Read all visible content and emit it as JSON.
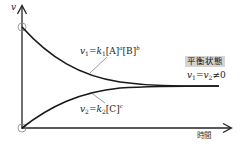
{
  "diagram": {
    "axes": {
      "y_label": "v",
      "x_label": "時間"
    },
    "curves": [
      {
        "id": "forward",
        "description": "forward reaction rate, decreasing",
        "label": {
          "lhs": "v",
          "lhs_sub": "1",
          "rate_const": "k",
          "rate_sub": "1",
          "terms": [
            {
              "species": "[A]",
              "exp": "a"
            },
            {
              "species": "[B]",
              "exp": "b"
            }
          ]
        }
      },
      {
        "id": "reverse",
        "description": "reverse reaction rate, increasing",
        "label": {
          "lhs": "v",
          "lhs_sub": "2",
          "rate_const": "k",
          "rate_sub": "2",
          "terms": [
            {
              "species": "[C]",
              "exp": "c"
            }
          ]
        }
      }
    ],
    "equilibrium": {
      "badge": "平衡状態",
      "condition": {
        "v1": "v",
        "v1_sub": "1",
        "eq": "=",
        "v2": "v",
        "v2_sub": "2",
        "ne": "≠",
        "zero": "0"
      }
    },
    "colors": {
      "line": "#1a1a1a",
      "axis": "#222222",
      "leader": "#555555",
      "badge_bg": "#d4d4d4",
      "circle": "#888888"
    }
  }
}
